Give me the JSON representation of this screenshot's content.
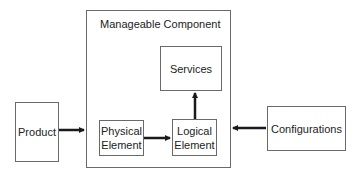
{
  "diagram": {
    "container": {
      "title": "Manageable Component"
    },
    "nodes": {
      "product": {
        "label": "Product"
      },
      "physical_element": {
        "line1": "Physical",
        "line2": "Element"
      },
      "logical_element": {
        "line1": "Logical",
        "line2": "Element"
      },
      "services": {
        "label": "Services"
      },
      "configurations": {
        "label": "Configurations"
      }
    },
    "edges": [
      {
        "from": "Product",
        "to": "Manageable Component"
      },
      {
        "from": "Physical Element",
        "to": "Logical Element"
      },
      {
        "from": "Logical Element",
        "to": "Services"
      },
      {
        "from": "Configurations",
        "to": "Manageable Component"
      }
    ],
    "colors": {
      "line": "#6a6a6a",
      "arrow": "#1a1a1a"
    }
  }
}
